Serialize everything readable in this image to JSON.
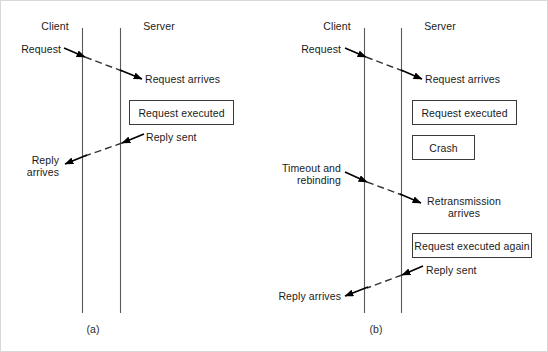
{
  "figure": {
    "background_color": "#ffffff",
    "line_color": "#555555",
    "arrow_color": "#000000",
    "text_color": "#1a1a1a",
    "width": 548,
    "height": 352
  },
  "panels": [
    {
      "id": "a",
      "caption": "(a)",
      "headers": {
        "client": "Client",
        "server": "Server"
      },
      "labels": {
        "request": "Request",
        "request_arrives": "Request arrives",
        "reply_sent": "Reply sent",
        "reply_arrives_line1": "Reply",
        "reply_arrives_line2": "arrives"
      },
      "boxes": [
        {
          "label": "Request executed"
        }
      ]
    },
    {
      "id": "b",
      "caption": "(b)",
      "headers": {
        "client": "Client",
        "server": "Server"
      },
      "labels": {
        "request": "Request",
        "request_arrives": "Request arrives",
        "timeout_line1": "Timeout and",
        "timeout_line2": "rebinding",
        "retransmission_line1": "Retransmission",
        "retransmission_line2": "arrives",
        "reply_sent": "Reply sent",
        "reply_arrives": "Reply arrives"
      },
      "boxes": [
        {
          "label": "Request executed"
        },
        {
          "label": "Crash"
        },
        {
          "label": "Request executed again"
        }
      ]
    }
  ]
}
